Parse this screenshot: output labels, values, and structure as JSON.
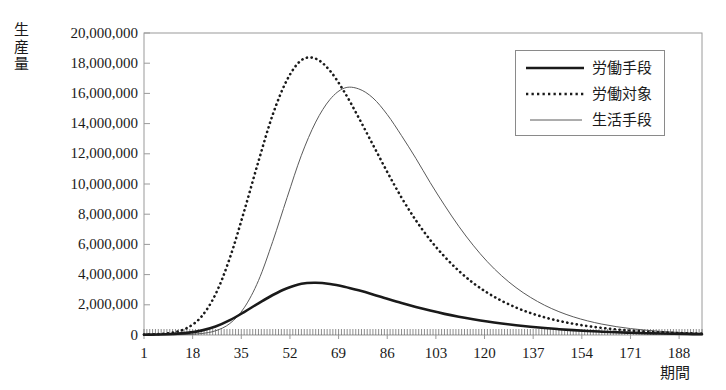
{
  "chart_data": {
    "type": "line",
    "title": "",
    "xlabel": "期間",
    "ylabel": "生産量",
    "xlim": [
      1,
      196
    ],
    "ylim": [
      0,
      20000000
    ],
    "grid": false,
    "legend_position": "top-right",
    "x_ticks": [
      "1",
      "18",
      "35",
      "52",
      "69",
      "86",
      "103",
      "120",
      "137",
      "154",
      "171",
      "188"
    ],
    "x_tick_values": [
      1,
      18,
      35,
      52,
      69,
      86,
      103,
      120,
      137,
      154,
      171,
      188
    ],
    "y_ticks": [
      "0",
      "2,000,000",
      "4,000,000",
      "6,000,000",
      "8,000,000",
      "10,000,000",
      "12,000,000",
      "14,000,000",
      "16,000,000",
      "18,000,000",
      "20,000,000"
    ],
    "y_tick_values": [
      0,
      2000000,
      4000000,
      6000000,
      8000000,
      10000000,
      12000000,
      14000000,
      16000000,
      18000000,
      20000000
    ],
    "series": [
      {
        "name": "労働手段",
        "style": "thick-solid",
        "color": "#1a1a1a",
        "peak_x": 55,
        "peak_y": 3450000,
        "x": [
          1,
          6,
          11,
          16,
          21,
          26,
          31,
          36,
          41,
          46,
          51,
          56,
          61,
          66,
          71,
          76,
          81,
          86,
          91,
          96,
          101,
          106,
          111,
          116,
          121,
          126,
          131,
          136,
          141,
          146,
          151,
          156,
          161,
          166,
          171,
          176,
          181,
          186,
          191,
          196
        ],
        "values": [
          20000,
          35000,
          70000,
          140000,
          290000,
          560000,
          980000,
          1520000,
          2100000,
          2650000,
          3100000,
          3400000,
          3460000,
          3380000,
          3200000,
          2960000,
          2690000,
          2400000,
          2120000,
          1860000,
          1620000,
          1400000,
          1210000,
          1040000,
          890000,
          760000,
          645000,
          545000,
          460000,
          385000,
          320000,
          265000,
          220000,
          180000,
          148000,
          120000,
          98000,
          78000,
          62000,
          50000
        ]
      },
      {
        "name": "労働対象",
        "style": "dotted",
        "color": "#1a1a1a",
        "peak_x": 54,
        "peak_y": 18300000,
        "x": [
          1,
          6,
          11,
          16,
          21,
          26,
          31,
          36,
          41,
          46,
          51,
          56,
          61,
          66,
          71,
          76,
          81,
          86,
          91,
          96,
          101,
          106,
          111,
          116,
          121,
          126,
          131,
          136,
          141,
          146,
          151,
          156,
          161,
          166,
          171,
          176,
          181,
          186,
          191,
          196
        ],
        "values": [
          30000,
          60000,
          160000,
          460000,
          1200000,
          2700000,
          5100000,
          8200000,
          11500000,
          14600000,
          16900000,
          18200000,
          18300000,
          17500000,
          16100000,
          14400000,
          12600000,
          10800000,
          9100000,
          7600000,
          6300000,
          5200000,
          4250000,
          3450000,
          2800000,
          2260000,
          1820000,
          1460000,
          1170000,
          935000,
          745000,
          590000,
          470000,
          372000,
          294000,
          232000,
          182000,
          143000,
          112000,
          88000
        ]
      },
      {
        "name": "生活手段",
        "style": "thin-solid",
        "color": "#5a5a5a",
        "peak_x": 71,
        "peak_y": 16400000,
        "x": [
          1,
          6,
          11,
          16,
          21,
          26,
          31,
          36,
          41,
          46,
          51,
          56,
          61,
          66,
          71,
          76,
          81,
          86,
          91,
          96,
          101,
          106,
          111,
          116,
          121,
          126,
          131,
          136,
          141,
          146,
          151,
          156,
          161,
          166,
          171,
          176,
          181,
          186,
          191,
          196
        ],
        "values": [
          5000,
          8000,
          15000,
          35000,
          95000,
          280000,
          760000,
          1800000,
          3600000,
          6200000,
          9100000,
          11900000,
          14100000,
          15600000,
          16350000,
          16300000,
          15700000,
          14600000,
          13200000,
          11700000,
          10100000,
          8600000,
          7200000,
          5950000,
          4850000,
          3920000,
          3140000,
          2500000,
          1970000,
          1545000,
          1205000,
          935000,
          722000,
          555000,
          425000,
          325000,
          248000,
          188000,
          143000,
          108000
        ]
      }
    ]
  },
  "legend": {
    "items": [
      {
        "label": "労働手段"
      },
      {
        "label": "労働対象"
      },
      {
        "label": "生活手段"
      }
    ]
  },
  "axes": {
    "y_title_chars": [
      "生",
      "産",
      "量"
    ],
    "x_title": "期間"
  }
}
